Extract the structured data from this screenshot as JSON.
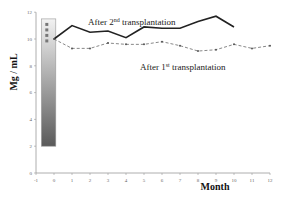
{
  "chart_data": {
    "type": "line",
    "title": "",
    "xlabel": "Month",
    "ylabel": "Mg / mL",
    "xlim": [
      -1,
      12
    ],
    "ylim": [
      0,
      12
    ],
    "x_ticks": [
      -1,
      0,
      1,
      2,
      3,
      4,
      5,
      6,
      7,
      8,
      9,
      10,
      11,
      12
    ],
    "y_ticks": [
      0,
      2,
      4,
      6,
      8,
      10,
      12
    ],
    "grid": false,
    "legend_position": "none",
    "series": [
      {
        "name": "After 2nd transplantation",
        "style": "solid",
        "color": "#222222",
        "x": [
          0,
          1,
          2,
          3,
          4,
          5,
          6,
          7,
          8,
          9,
          10
        ],
        "values": [
          10.0,
          11.0,
          10.5,
          10.6,
          10.1,
          10.9,
          10.8,
          10.8,
          11.3,
          11.7,
          10.9
        ]
      },
      {
        "name": "After 1st transplantation",
        "style": "dashed-markers",
        "color": "#555555",
        "x": [
          0,
          1,
          2,
          3,
          4,
          5,
          6,
          7,
          8,
          9,
          10,
          11,
          12
        ],
        "values": [
          10.0,
          9.3,
          9.3,
          9.7,
          9.6,
          9.6,
          9.8,
          9.5,
          9.1,
          9.2,
          9.6,
          9.3,
          9.5
        ]
      }
    ],
    "annotations": [
      {
        "text_main": "After 2",
        "sup": "nd",
        "text_rest": " transplantation",
        "near_series": 0
      },
      {
        "text_main": "After 1",
        "sup": "st",
        "text_rest": " transplantation",
        "near_series": 1
      }
    ],
    "gradient_bar": {
      "x_range": [
        -0.7,
        0.1
      ],
      "y_range": [
        2,
        11.5
      ],
      "markers": 4
    }
  }
}
